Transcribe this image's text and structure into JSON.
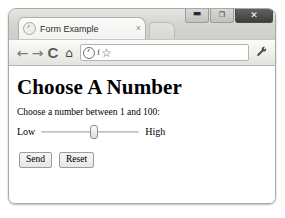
{
  "window": {
    "controls": [
      {
        "name": "minimize",
        "glyph": "▬"
      },
      {
        "name": "maximize",
        "glyph": "❐"
      },
      {
        "name": "close",
        "glyph": "✕"
      }
    ]
  },
  "tab_strip": {
    "active_tab": {
      "title": "Form Example",
      "favicon": "globe-icon",
      "close_glyph": "×"
    },
    "new_tab_label": ""
  },
  "toolbar": {
    "back_glyph": "←",
    "forward_glyph": "→",
    "reload_glyph": "C",
    "home_glyph": "⌂",
    "omnibox": {
      "globe_icon": "globe-icon",
      "page_icon": "f",
      "star_glyph": "☆",
      "value": "",
      "placeholder": ""
    },
    "menu_glyph": "🔧"
  },
  "page": {
    "heading": "Choose A Number",
    "instruction": "Choose a number between 1 and 100:",
    "slider": {
      "low_label": "Low",
      "high_label": "High",
      "min": 1,
      "max": 100,
      "value": 55
    },
    "buttons": {
      "send_label": "Send",
      "reset_label": "Reset"
    }
  },
  "colors": {
    "page_background": "#ffffff",
    "chrome_frame": "#e9e9e6",
    "close_button": "#3d3d3c",
    "text": "#000000"
  }
}
